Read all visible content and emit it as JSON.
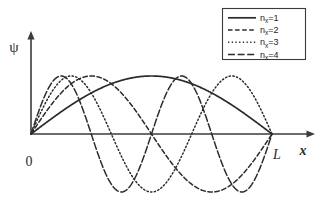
{
  "figure": {
    "title": "",
    "background_color": "#ffffff",
    "line_color": "#2b2b2b",
    "axis_color": "#3b3b3b"
  },
  "axes": {
    "y_label": "ψ",
    "x_label": "x",
    "origin_label": "0",
    "end_label": "L"
  },
  "legend": {
    "entries": [
      {
        "label_base": "n",
        "label_sub": "x",
        "label_eq": "=1",
        "style": "solid",
        "n": 1
      },
      {
        "label_base": "n",
        "label_sub": "x",
        "label_eq": "=2",
        "style": "dashed",
        "n": 2
      },
      {
        "label_base": "n",
        "label_sub": "x",
        "label_eq": "=3",
        "style": "dotted",
        "n": 3
      },
      {
        "label_base": "n",
        "label_sub": "x",
        "label_eq": "=4",
        "style": "dashdot",
        "n": 4
      }
    ]
  },
  "chart_data": {
    "type": "line",
    "title": "",
    "xlabel": "x",
    "ylabel": "ψ",
    "xlim": [
      0,
      1
    ],
    "ylim": [
      -1.15,
      1.15
    ],
    "x_tick_labels": [
      "0",
      "L"
    ],
    "x_tick_values": [
      0,
      1
    ],
    "y_tick_labels": [],
    "grid": false,
    "legend_position": "top-right",
    "function": "psi_n(x) = A * sin(n * pi * x / L)",
    "amplitude": 1.0,
    "series": [
      {
        "name": "n_x=1",
        "n": 1,
        "style": "solid",
        "nodes": [
          0,
          1
        ],
        "x": [
          0,
          0.05,
          0.1,
          0.15,
          0.2,
          0.25,
          0.3,
          0.35,
          0.4,
          0.45,
          0.5,
          0.55,
          0.6,
          0.65,
          0.7,
          0.75,
          0.8,
          0.85,
          0.9,
          0.95,
          1
        ],
        "values": [
          0,
          0.156,
          0.309,
          0.454,
          0.588,
          0.707,
          0.809,
          0.891,
          0.951,
          0.988,
          1,
          0.988,
          0.951,
          0.891,
          0.809,
          0.707,
          0.588,
          0.454,
          0.309,
          0.156,
          0
        ]
      },
      {
        "name": "n_x=2",
        "n": 2,
        "style": "dashed",
        "nodes": [
          0,
          0.5,
          1
        ],
        "x": [
          0,
          0.05,
          0.1,
          0.15,
          0.2,
          0.25,
          0.3,
          0.35,
          0.4,
          0.45,
          0.5,
          0.55,
          0.6,
          0.65,
          0.7,
          0.75,
          0.8,
          0.85,
          0.9,
          0.95,
          1
        ],
        "values": [
          0,
          0.309,
          0.588,
          0.809,
          0.951,
          1,
          0.951,
          0.809,
          0.588,
          0.309,
          0,
          -0.309,
          -0.588,
          -0.809,
          -0.951,
          -1,
          -0.951,
          -0.809,
          -0.588,
          -0.309,
          0
        ]
      },
      {
        "name": "n_x=3",
        "n": 3,
        "style": "dotted",
        "nodes": [
          0,
          0.333,
          0.667,
          1
        ],
        "x": [
          0,
          0.05,
          0.1,
          0.15,
          0.2,
          0.25,
          0.3,
          0.35,
          0.4,
          0.45,
          0.5,
          0.55,
          0.6,
          0.65,
          0.7,
          0.75,
          0.8,
          0.85,
          0.9,
          0.95,
          1
        ],
        "values": [
          0,
          0.454,
          0.809,
          0.988,
          0.951,
          0.707,
          0.309,
          -0.156,
          -0.588,
          -0.891,
          -1,
          -0.891,
          -0.588,
          -0.156,
          0.309,
          0.707,
          0.951,
          0.988,
          0.809,
          0.454,
          0
        ]
      },
      {
        "name": "n_x=4",
        "n": 4,
        "style": "dashdot",
        "nodes": [
          0,
          0.25,
          0.5,
          0.75,
          1
        ],
        "x": [
          0,
          0.05,
          0.1,
          0.15,
          0.2,
          0.25,
          0.3,
          0.35,
          0.4,
          0.45,
          0.5,
          0.55,
          0.6,
          0.65,
          0.7,
          0.75,
          0.8,
          0.85,
          0.9,
          0.95,
          1
        ],
        "values": [
          0,
          0.588,
          0.951,
          0.951,
          0.588,
          0,
          -0.588,
          -0.951,
          -0.951,
          -0.588,
          0,
          0.588,
          0.951,
          0.951,
          0.588,
          0,
          -0.588,
          -0.951,
          -0.951,
          -0.588,
          0
        ]
      }
    ]
  }
}
